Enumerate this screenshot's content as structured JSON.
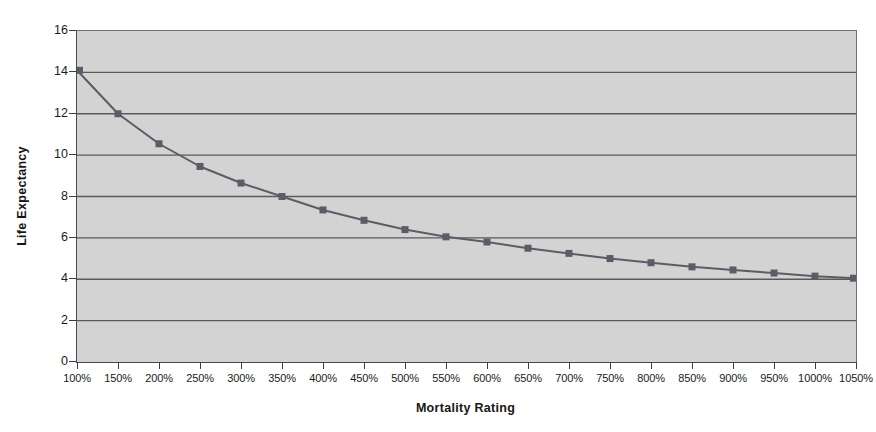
{
  "chart_data": {
    "type": "line",
    "title": "",
    "xlabel": "Mortality Rating",
    "ylabel": "Life Expectancy",
    "categories": [
      "100%",
      "150%",
      "200%",
      "250%",
      "300%",
      "350%",
      "400%",
      "450%",
      "500%",
      "550%",
      "600%",
      "650%",
      "700%",
      "750%",
      "800%",
      "850%",
      "900%",
      "950%",
      "1000%",
      "1050%"
    ],
    "values": [
      14.1,
      12.0,
      10.55,
      9.45,
      8.65,
      8.0,
      7.35,
      6.85,
      6.4,
      6.05,
      5.8,
      5.5,
      5.25,
      5.0,
      4.8,
      4.6,
      4.45,
      4.3,
      4.15,
      4.05
    ],
    "series": [
      {
        "name": "Life Expectancy",
        "values": [
          14.1,
          12.0,
          10.55,
          9.45,
          8.65,
          8.0,
          7.35,
          6.85,
          6.4,
          6.05,
          5.8,
          5.5,
          5.25,
          5.0,
          4.8,
          4.6,
          4.45,
          4.3,
          4.15,
          4.05
        ]
      }
    ],
    "ylim": [
      0,
      16
    ],
    "ytick_values": [
      0,
      2,
      4,
      6,
      8,
      10,
      12,
      14,
      16
    ],
    "ytick_labels": [
      "0",
      "2",
      "4",
      "6",
      "8",
      "10",
      "12",
      "14",
      "16"
    ],
    "grid": true,
    "grid_axis": "y",
    "legend": false,
    "legend_position": "none",
    "marker": "square",
    "colors": {
      "plot_background": "#d3d3d3",
      "page_background": "#ffffff",
      "gridline": "#5a5a5a",
      "axis": "#3d3d3d",
      "series_line": "#5c5c66",
      "marker_fill": "#5c5c66",
      "text": "#1a1a1a"
    }
  }
}
